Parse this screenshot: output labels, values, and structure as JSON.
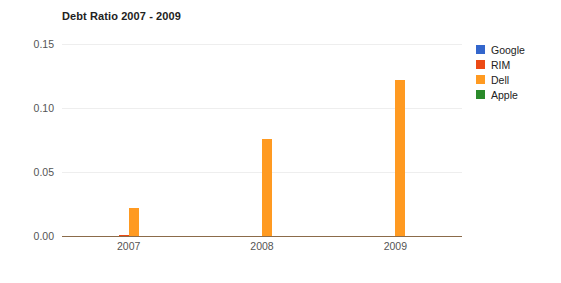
{
  "chart_data": {
    "type": "bar",
    "title": "Debt Ratio 2007 - 2009",
    "xlabel": "",
    "ylabel": "",
    "categories": [
      "2007",
      "2008",
      "2009"
    ],
    "series": [
      {
        "name": "Google",
        "color": "#3366cc",
        "values": [
          0.0,
          0.0,
          0.0
        ]
      },
      {
        "name": "RIM",
        "color": "#ec4a15",
        "values": [
          0.0008,
          0.0,
          0.0
        ]
      },
      {
        "name": "Dell",
        "color": "#ff9a21",
        "values": [
          0.022,
          0.0755,
          0.1215
        ]
      },
      {
        "name": "Apple",
        "color": "#2a8a2a",
        "values": [
          0.0,
          0.0,
          0.0
        ]
      }
    ],
    "ylim": [
      0.0,
      0.15
    ],
    "yticks": [
      "0.00",
      "0.05",
      "0.10",
      "0.15"
    ],
    "ytick_values": [
      0.0,
      0.05,
      0.1,
      0.15
    ],
    "grid": true,
    "legend_position": "right",
    "axis_color": "#8b6b4a",
    "grid_color": "#eeeeee"
  }
}
